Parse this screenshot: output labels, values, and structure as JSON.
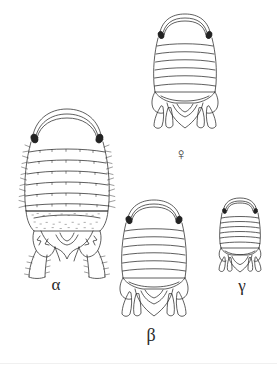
{
  "plate": {
    "title": "Isopod morphotype plate",
    "background_color": "#ffffff",
    "ink_color": "#2a2a2a",
    "figure_count": 4
  },
  "labels": {
    "alpha": "α",
    "beta": "β",
    "gamma": "γ",
    "female": "♀"
  },
  "figures": [
    {
      "id": "alpha",
      "label": "α",
      "label_position": "below",
      "description": "Large spiny isopod morphotype, dorsal view, with setose lateral margins and elongate spinose uropods",
      "relative_size": "largest",
      "segment_count": 7,
      "has_eyes": true,
      "has_lateral_spines": true,
      "has_uropods": true
    },
    {
      "id": "female",
      "label": "♀",
      "label_position": "below",
      "description": "Female isopod, dorsal view, smooth pereon with broad pleotelson and paired uropod lobes",
      "relative_size": "large",
      "segment_count": 7,
      "has_eyes": true,
      "has_lateral_spines": false,
      "has_uropods": true
    },
    {
      "id": "beta",
      "label": "β",
      "label_position": "below",
      "description": "Intermediate isopod morphotype, dorsal view, smooth pereon with paired uropod lobes",
      "relative_size": "medium",
      "segment_count": 7,
      "has_eyes": true,
      "has_lateral_spines": false,
      "has_uropods": true
    },
    {
      "id": "gamma",
      "label": "γ",
      "label_position": "below",
      "description": "Smallest isopod morphotype, dorsal view, narrow body with short uropods",
      "relative_size": "smallest",
      "segment_count": 7,
      "has_eyes": true,
      "has_lateral_spines": false,
      "has_uropods": true
    }
  ]
}
